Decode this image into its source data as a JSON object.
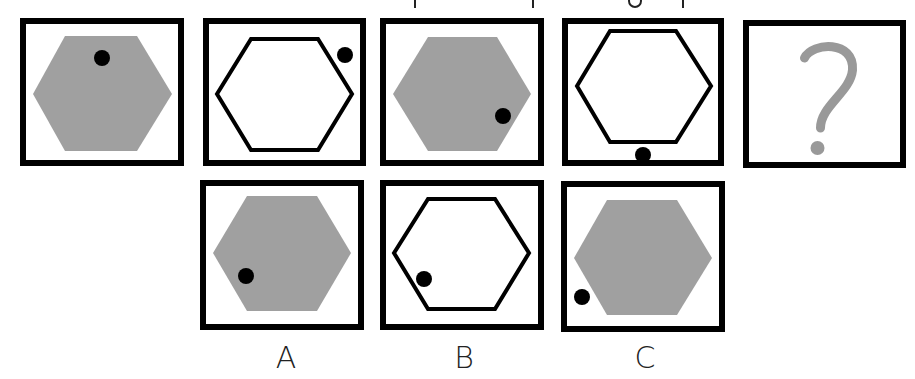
{
  "puzzle": {
    "type": "visual-sequence",
    "shape_fill_gray": "#a0a0a0",
    "outline_color": "#000000",
    "dot_color": "#000000",
    "question_mark_color": "#999999",
    "sequence": [
      {
        "id": "seq-1",
        "box": [
          20,
          18,
          164,
          148
        ],
        "hexagon": "filled",
        "hex_points": "33,94 65,36 137,36 172,94 137,151 65,151",
        "dot": [
          102,
          58
        ]
      },
      {
        "id": "seq-2",
        "box": [
          203,
          18,
          163,
          148
        ],
        "hexagon": "outline",
        "hex_points": "217,94 251,39 318,39 352,94 318,150 251,150",
        "dot": [
          345,
          55
        ]
      },
      {
        "id": "seq-3",
        "box": [
          380,
          18,
          164,
          148
        ],
        "hexagon": "filled",
        "hex_points": "393,94 428,37 497,37 531,94 497,151 428,151",
        "dot": [
          503,
          116
        ]
      },
      {
        "id": "seq-4",
        "box": [
          562,
          18,
          162,
          148
        ],
        "hexagon": "outline",
        "hex_points": "577,86 610,31 676,31 711,86 676,142 610,142",
        "dot": [
          643,
          155
        ]
      },
      {
        "id": "seq-5",
        "box": [
          743,
          20,
          163,
          148
        ],
        "question_mark": "?"
      }
    ],
    "options": [
      {
        "label": "A",
        "box": [
          200,
          180,
          164,
          150
        ],
        "hexagon": "filled",
        "hex_points": "213,253 247,196 317,196 351,253 317,311 247,311",
        "dot": [
          246,
          276
        ],
        "label_pos": [
          286,
          344
        ]
      },
      {
        "label": "B",
        "box": [
          380,
          180,
          164,
          150
        ],
        "hexagon": "outline",
        "hex_points": "394,253 428,199 495,199 529,253 495,309 428,309",
        "dot": [
          424,
          279
        ],
        "label_pos": [
          464,
          344
        ]
      },
      {
        "label": "C",
        "box": [
          561,
          181,
          164,
          151
        ],
        "hexagon": "filled",
        "hex_points": "574,258 607,200 677,200 712,258 677,315 607,315",
        "dot": [
          582,
          297
        ],
        "label_pos": [
          645,
          344
        ]
      }
    ]
  }
}
